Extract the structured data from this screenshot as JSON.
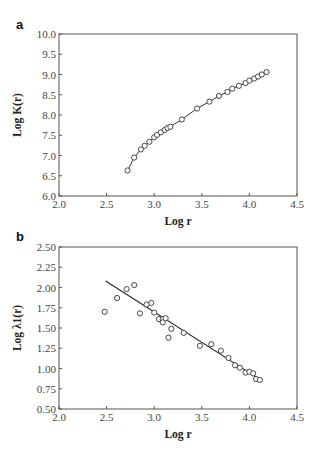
{
  "panels": [
    {
      "label": "a"
    },
    {
      "label": "b"
    }
  ],
  "chart_data": [
    {
      "type": "line",
      "panel": "a",
      "title": "",
      "xlabel": "Log r",
      "ylabel": "Log K(r)",
      "xlim": [
        2.0,
        4.5
      ],
      "ylim": [
        6.0,
        10.0
      ],
      "xticks": [
        "2.0",
        "2.5",
        "3.0",
        "3.5",
        "4.0",
        "4.5"
      ],
      "yticks": [
        "6.0",
        "6.5",
        "7.0",
        "7.5",
        "8.0",
        "8.5",
        "9.0",
        "9.5",
        "10.0"
      ],
      "grid": false,
      "markers": "open-circle",
      "series": [
        {
          "name": "Log K(r)",
          "x": [
            2.72,
            2.79,
            2.86,
            2.9,
            2.95,
            3.0,
            3.03,
            3.07,
            3.11,
            3.14,
            3.17,
            3.29,
            3.45,
            3.58,
            3.68,
            3.77,
            3.82,
            3.89,
            3.96,
            4.0,
            4.05,
            4.09,
            4.13,
            4.18
          ],
          "y": [
            6.63,
            6.95,
            7.15,
            7.24,
            7.34,
            7.45,
            7.51,
            7.57,
            7.63,
            7.68,
            7.71,
            7.89,
            8.16,
            8.33,
            8.47,
            8.57,
            8.65,
            8.72,
            8.79,
            8.85,
            8.9,
            8.95,
            9.0,
            9.06
          ]
        }
      ]
    },
    {
      "type": "scatter",
      "panel": "b",
      "title": "",
      "xlabel": "Log r",
      "ylabel": "Log λ1(r)",
      "xlim": [
        2.0,
        4.5
      ],
      "ylim": [
        0.5,
        2.5
      ],
      "xticks": [
        "2.0",
        "2.5",
        "3.0",
        "3.5",
        "4.0",
        "4.5"
      ],
      "yticks": [
        "0.50",
        "0.75",
        "1.00",
        "1.25",
        "1.50",
        "1.75",
        "2.00",
        "2.25",
        "2.50"
      ],
      "grid": false,
      "markers": "open-circle",
      "series": [
        {
          "name": "Log λ1(r)",
          "x": [
            2.48,
            2.61,
            2.71,
            2.79,
            2.85,
            2.92,
            2.97,
            3.0,
            3.05,
            3.09,
            3.09,
            3.12,
            3.15,
            3.18,
            3.31,
            3.48,
            3.6,
            3.7,
            3.78,
            3.85,
            3.9,
            3.96,
            4.0,
            4.04,
            4.07,
            4.11
          ],
          "y": [
            1.7,
            1.87,
            1.98,
            2.03,
            1.68,
            1.79,
            1.81,
            1.69,
            1.61,
            1.61,
            1.57,
            1.62,
            1.38,
            1.49,
            1.44,
            1.28,
            1.3,
            1.22,
            1.13,
            1.04,
            1.01,
            0.95,
            0.96,
            0.94,
            0.87,
            0.86
          ]
        }
      ],
      "fit_line": {
        "x": [
          2.49,
          4.13
        ],
        "y": [
          2.08,
          0.85
        ]
      }
    }
  ]
}
